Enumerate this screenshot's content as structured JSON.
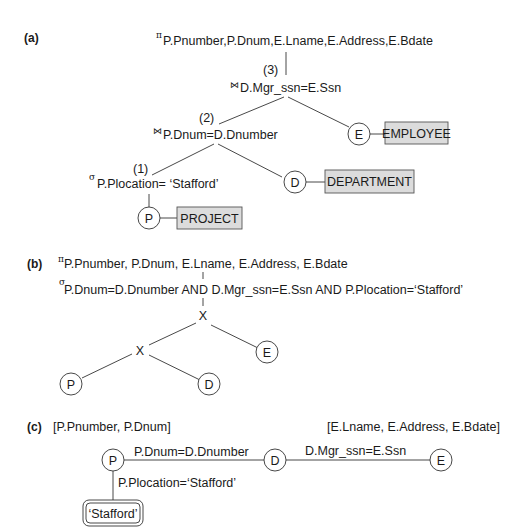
{
  "part_a": {
    "label": "(a)",
    "projection_symbol": "π",
    "projection": "P.Pnumber,P.Dnum,E.Lname,E.Address,E.Bdate",
    "join_symbol": "⋈",
    "step3": "(3)",
    "join3": "D.Mgr_ssn=E.Ssn",
    "step2": "(2)",
    "join2": "P.Dnum=D.Dnumber",
    "step1": "(1)",
    "select_symbol": "σ",
    "select1": "P.Plocation= ‘Stafford’",
    "nodes": {
      "P": "P",
      "D": "D",
      "E": "E"
    },
    "relations": {
      "project": "PROJECT",
      "department": "DEPARTMENT",
      "employee": "EMPLOYEE"
    }
  },
  "part_b": {
    "label": "(b)",
    "projection_symbol": "π",
    "projection": "P.Pnumber, P.Dnum, E.Lname, E.Address, E.Bdate",
    "select_symbol": "σ",
    "select": "P.Dnum=D.Dnumber AND D.Mgr_ssn=E.Ssn AND P.Plocation=‘Stafford’",
    "cross_symbol": "X",
    "nodes": {
      "P": "P",
      "D": "D",
      "E": "E"
    }
  },
  "part_c": {
    "label": "(c)",
    "left_attrs": "[P.Pnumber, P.Dnum]",
    "right_attrs": "[E.Lname, E.Address, E.Bdate]",
    "edge_pd": "P.Dnum=D.Dnumber",
    "edge_de": "D.Mgr_ssn=E.Ssn",
    "edge_p_const": "P.Plocation=‘Stafford’",
    "constant": "‘Stafford’",
    "nodes": {
      "P": "P",
      "D": "D",
      "E": "E"
    }
  }
}
